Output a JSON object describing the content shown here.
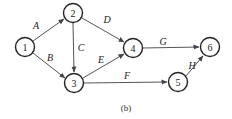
{
  "diagram": {
    "caption": "(b)",
    "nodes": [
      {
        "id": "1",
        "label": "1",
        "x": 25,
        "y": 47
      },
      {
        "id": "2",
        "label": "2",
        "x": 73,
        "y": 13
      },
      {
        "id": "3",
        "label": "3",
        "x": 74,
        "y": 83
      },
      {
        "id": "4",
        "label": "4",
        "x": 133,
        "y": 48
      },
      {
        "id": "5",
        "label": "5",
        "x": 178,
        "y": 82
      },
      {
        "id": "6",
        "label": "6",
        "x": 210,
        "y": 47
      }
    ],
    "edges": [
      {
        "label": "A",
        "from": "1",
        "to": "2"
      },
      {
        "label": "B",
        "from": "1",
        "to": "3"
      },
      {
        "label": "C",
        "from": "2",
        "to": "3"
      },
      {
        "label": "D",
        "from": "2",
        "to": "4"
      },
      {
        "label": "E",
        "from": "3",
        "to": "4"
      },
      {
        "label": "F",
        "from": "3",
        "to": "5"
      },
      {
        "label": "G",
        "from": "4",
        "to": "6"
      },
      {
        "label": "H",
        "from": "5",
        "to": "6"
      }
    ]
  }
}
